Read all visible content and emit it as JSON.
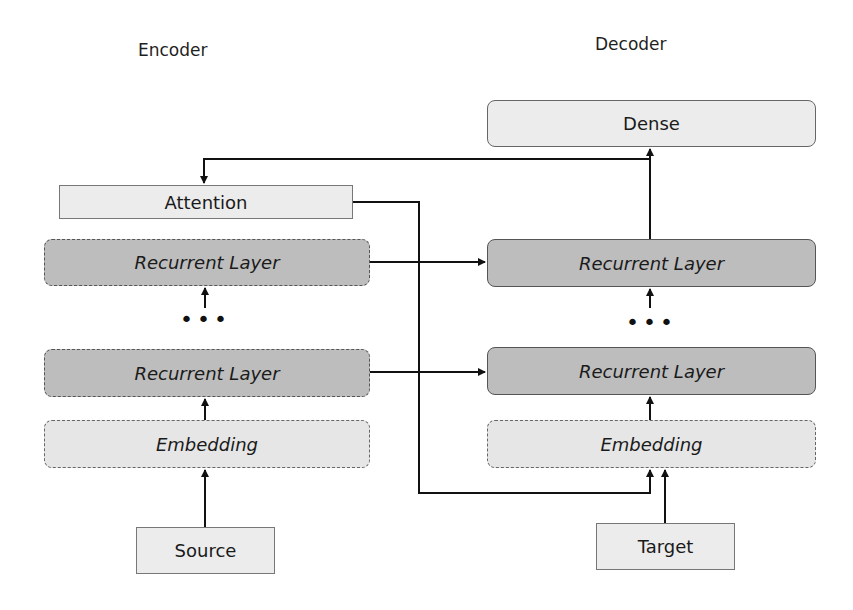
{
  "encoder": {
    "title": "Encoder",
    "attention": "Attention",
    "recurrent_top": "Recurrent Layer",
    "recurrent_bottom": "Recurrent Layer",
    "ellipsis": "•••",
    "embedding": "Embedding",
    "input": "Source"
  },
  "decoder": {
    "title": "Decoder",
    "dense": "Dense",
    "recurrent_top": "Recurrent Layer",
    "recurrent_bottom": "Recurrent Layer",
    "ellipsis": "•••",
    "embedding": "Embedding",
    "input": "Target"
  },
  "colors": {
    "light_fill": "#ececec",
    "dark_fill": "#bdbdbd",
    "line": "#111111"
  }
}
